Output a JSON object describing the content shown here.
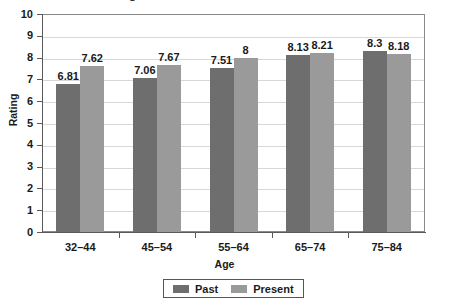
{
  "chart_data": {
    "type": "bar",
    "title": "Ratings of Past and Present Life Satisfaction",
    "xlabel": "Age",
    "ylabel": "Rating",
    "categories": [
      "32–44",
      "45–54",
      "55–64",
      "65–74",
      "75–84"
    ],
    "series": [
      {
        "name": "Past",
        "color": "#6e6e6e",
        "values": [
          6.81,
          7.06,
          7.51,
          8.13,
          8.3
        ],
        "labels": [
          "6.81",
          "7.06",
          "7.51",
          "8.13",
          "8.3"
        ]
      },
      {
        "name": "Present",
        "color": "#9a9a9a",
        "values": [
          7.62,
          7.67,
          8.0,
          8.21,
          8.18
        ],
        "labels": [
          "7.62",
          "7.67",
          "8",
          "8.21",
          "8.18"
        ]
      }
    ],
    "ylim": [
      0,
      10
    ],
    "yticks": [
      "0",
      "1",
      "2",
      "3",
      "4",
      "5",
      "6",
      "7",
      "8",
      "9",
      "10"
    ],
    "grid": true,
    "legend_position": "bottom"
  }
}
